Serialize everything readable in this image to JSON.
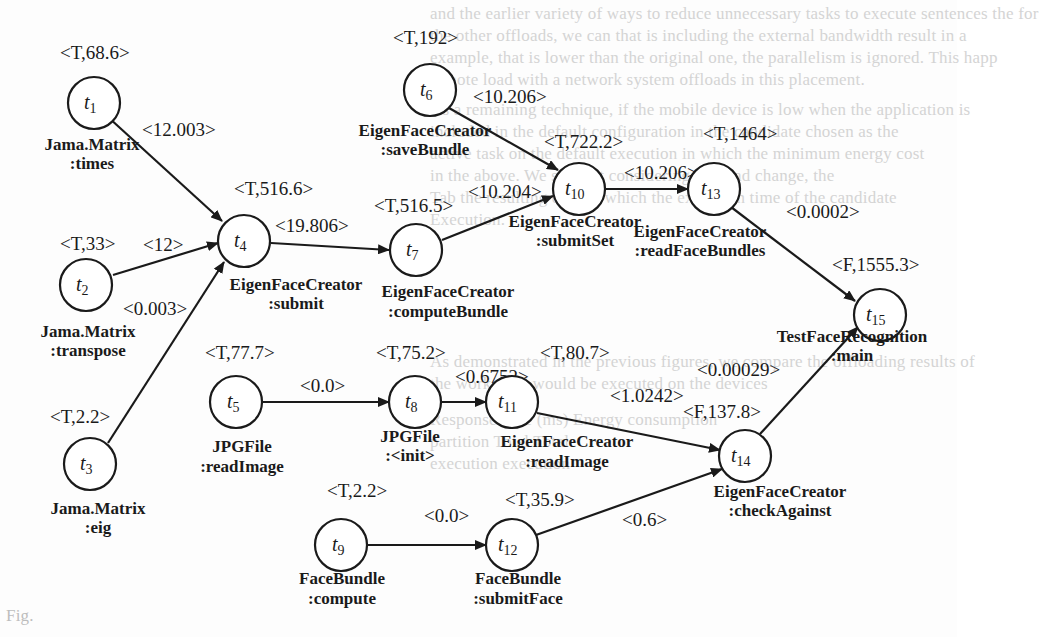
{
  "figure": {
    "type": "directed-task-graph",
    "caption_fragment": "Fig."
  },
  "background_text": [
    "and the earlier variety of ways to reduce unnecessary tasks to execute sentences the for",
    "the other offloads, we can that is including the external bandwidth result in a",
    "example, that is lower than the original one, the parallelism is ignored. This happ",
    "remote load with a network system offloads in this placement.",
    "As a remaining technique, if the mobile device is low when the application is",
    "included in the default configuration in the candidate chosen as the",
    "active task on the default execution in which the minimum energy cost",
    "in the above. We see that considering the load change, the",
    "Tab the resulting case in which the execution time of the candidate",
    "Execution.",
    "As demonstrated in the previous figures, we compare the offloading results of",
    "the works and would be executed on the devices",
    "Response time (ms)     Energy consumption",
    "partition      Total    Total",
    "execution       execution",
    "..."
  ],
  "nodes": [
    {
      "id": "t1",
      "num": "1",
      "attr": "<T,68.6>",
      "class": "Jama.Matrix",
      "method": ":times"
    },
    {
      "id": "t2",
      "num": "2",
      "attr": "<T,33>",
      "class": "Jama.Matrix",
      "method": ":transpose"
    },
    {
      "id": "t3",
      "num": "3",
      "attr": "<T,2.2>",
      "class": "Jama.Matrix",
      "method": ":eig"
    },
    {
      "id": "t4",
      "num": "4",
      "attr": "<T,516.6>",
      "class": "EigenFaceCreator",
      "method": ":submit"
    },
    {
      "id": "t5",
      "num": "5",
      "attr": "<T,77.7>",
      "class": "JPGFile",
      "method": ":readImage"
    },
    {
      "id": "t6",
      "num": "6",
      "attr": "<T,192>",
      "class": "EigenFaceCreator",
      "method": ":saveBundle"
    },
    {
      "id": "t7",
      "num": "7",
      "attr": "<T,516.5>",
      "class": "EigenFaceCreator",
      "method": ":computeBundle"
    },
    {
      "id": "t8",
      "num": "8",
      "attr": "<T,75.2>",
      "class": "JPGFile",
      "method": ":<init>"
    },
    {
      "id": "t9",
      "num": "9",
      "attr": "<T,2.2>",
      "class": "FaceBundle",
      "method": ":compute"
    },
    {
      "id": "t10",
      "num": "10",
      "attr": "<T,722.2>",
      "class": "EigenFaceCreator",
      "method": ":submitSet"
    },
    {
      "id": "t11",
      "num": "11",
      "attr": "<T,80.7>",
      "class": "EigenFaceCreator",
      "method": ":readImage"
    },
    {
      "id": "t12",
      "num": "12",
      "attr": "<T,35.9>",
      "class": "FaceBundle",
      "method": ":submitFace"
    },
    {
      "id": "t13",
      "num": "13",
      "attr": "<T,1464>",
      "class": "EigenFaceCreator",
      "method": ":readFaceBundles"
    },
    {
      "id": "t14",
      "num": "14",
      "attr": "<F,137.8>",
      "class": "EigenFaceCreator",
      "method": ":checkAgainst"
    },
    {
      "id": "t15",
      "num": "15",
      "attr": "<F,1555.3>",
      "class": "TestFaceRecognition",
      "method": ":main"
    }
  ],
  "edges": [
    {
      "from": "t1",
      "to": "t4",
      "weight": "<12.003>"
    },
    {
      "from": "t2",
      "to": "t4",
      "weight": "<12>"
    },
    {
      "from": "t3",
      "to": "t4",
      "weight": "<0.003>"
    },
    {
      "from": "t4",
      "to": "t7",
      "weight": "<19.806>"
    },
    {
      "from": "t6",
      "to": "t10",
      "weight": "<10.206>"
    },
    {
      "from": "t7",
      "to": "t10",
      "weight": "<10.204>"
    },
    {
      "from": "t10",
      "to": "t13",
      "weight": "<10.206>"
    },
    {
      "from": "t13",
      "to": "t15",
      "weight": "<0.0002>"
    },
    {
      "from": "t5",
      "to": "t8",
      "weight": "<0.0>"
    },
    {
      "from": "t8",
      "to": "t11",
      "weight": "<0.6752>"
    },
    {
      "from": "t11",
      "to": "t14",
      "weight": "<1.0242>"
    },
    {
      "from": "t9",
      "to": "t12",
      "weight": "<0.0>"
    },
    {
      "from": "t12",
      "to": "t14",
      "weight": "<0.6>"
    },
    {
      "from": "t14",
      "to": "t15",
      "weight": "<0.00029>"
    }
  ]
}
